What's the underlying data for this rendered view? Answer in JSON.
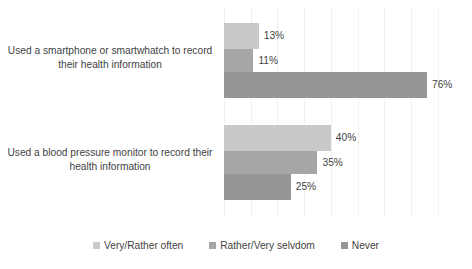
{
  "chart_data": {
    "type": "bar",
    "orientation": "horizontal",
    "title": "",
    "subtitle": "",
    "xlabel": "",
    "ylabel": "",
    "xlim": [
      0,
      80
    ],
    "grid": true,
    "grid_axis": "x",
    "legend_position": "bottom",
    "value_suffix": "%",
    "categories": [
      "Used a smartphone or smartwhatch to record their health information",
      "Used a blood pressure monitor to record their health information"
    ],
    "series": [
      {
        "name": "Very/Rather often",
        "color": "#c9c9c9",
        "values": [
          13,
          40
        ],
        "labels": [
          "13%",
          "40%"
        ]
      },
      {
        "name": "Rather/Very selvdom",
        "color": "#a6a6a6",
        "values": [
          11,
          35
        ],
        "labels": [
          "11%",
          "35%"
        ]
      },
      {
        "name": "Never",
        "color": "#969696",
        "values": [
          76,
          25
        ],
        "labels": [
          "76%",
          "25%"
        ]
      }
    ]
  },
  "legend": {
    "items": [
      {
        "label": "Very/Rather often",
        "color": "#c9c9c9",
        "marker": "square-swatch"
      },
      {
        "label": "Rather/Very selvdom",
        "color": "#a6a6a6",
        "marker": "square-swatch"
      },
      {
        "label": "Never",
        "color": "#969696",
        "marker": "square-swatch"
      }
    ]
  },
  "colors": {
    "background": "#ffffff",
    "text": "#3f3f3f",
    "gridline": "#f0f0f0"
  }
}
